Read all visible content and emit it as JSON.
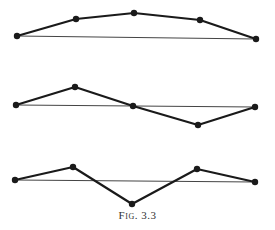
{
  "figure": {
    "caption": "Fig. 3.3",
    "colors": {
      "line": "#1a1a1a",
      "baseline": "#444444",
      "background": "#ffffff"
    },
    "diagrams": [
      {
        "name": "polyline-1",
        "baseline": [
          [
            17,
            36
          ],
          [
            256,
            39
          ]
        ],
        "points": [
          [
            17,
            36
          ],
          [
            76,
            19
          ],
          [
            134,
            13
          ],
          [
            200,
            20
          ],
          [
            256,
            39
          ]
        ]
      },
      {
        "name": "polyline-2",
        "baseline": [
          [
            16,
            105
          ],
          [
            255,
            107
          ]
        ],
        "points": [
          [
            16,
            105
          ],
          [
            75,
            87
          ],
          [
            133,
            106
          ],
          [
            198,
            125
          ],
          [
            255,
            107
          ]
        ]
      },
      {
        "name": "polyline-3",
        "baseline": [
          [
            15,
            180
          ],
          [
            255,
            182
          ]
        ],
        "points": [
          [
            15,
            180
          ],
          [
            73,
            167
          ],
          [
            132,
            204
          ],
          [
            197,
            169
          ],
          [
            255,
            182
          ]
        ]
      }
    ]
  }
}
